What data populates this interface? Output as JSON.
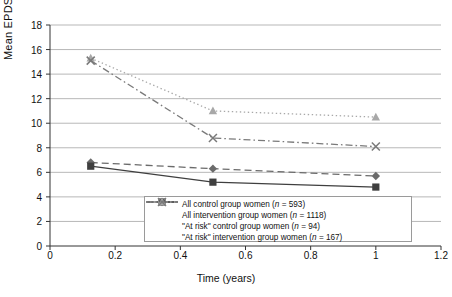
{
  "chart_data": {
    "type": "line",
    "title": "",
    "xlabel": "Time (years)",
    "ylabel": "Mean EPDS score",
    "xlim": [
      0,
      1.2
    ],
    "ylim": [
      0,
      18
    ],
    "xticks": [
      "0",
      "0.2",
      "0.4",
      "0.6",
      "0.8",
      "1",
      "1.2"
    ],
    "xtick_values": [
      0,
      0.2,
      0.4,
      0.6,
      0.8,
      1,
      1.2
    ],
    "yticks": [
      "0",
      "2",
      "4",
      "6",
      "8",
      "10",
      "12",
      "14",
      "16",
      "18"
    ],
    "ytick_values": [
      0,
      2,
      4,
      6,
      8,
      10,
      12,
      14,
      16,
      18
    ],
    "grid": "horizontal",
    "legend_position": "inside-bottom-center",
    "x": [
      0.125,
      0.5,
      1.0
    ],
    "series": [
      {
        "name": "All control group women (n = 593)",
        "label_main": "All control group women (",
        "label_n": "n",
        "label_tail": " = 593)",
        "marker": "diamond",
        "linestyle": "dashed",
        "color": "#6b6b6b",
        "values": [
          6.8,
          6.3,
          5.7
        ]
      },
      {
        "name": "All intervention group women (n = 1118)",
        "label_main": "All intervention group women (",
        "label_n": "n",
        "label_tail": " = 1118)",
        "marker": "square",
        "linestyle": "solid",
        "color": "#3f3f3f",
        "values": [
          6.5,
          5.2,
          4.8
        ]
      },
      {
        "name": "\"At risk\" control group women (n = 94)",
        "label_main": "\"At risk\" control group women (",
        "label_n": "n",
        "label_tail": " = 94)",
        "marker": "triangle",
        "linestyle": "dotted",
        "color": "#a8a8a8",
        "values": [
          15.3,
          11.0,
          10.5
        ]
      },
      {
        "name": "\"At risk\" intervention group women (n = 167)",
        "label_main": "\"At risk\" intervention group women (",
        "label_n": "n",
        "label_tail": " = 167)",
        "marker": "cross",
        "linestyle": "dashdot",
        "color": "#7a7a7a",
        "values": [
          15.1,
          8.8,
          8.1
        ]
      }
    ]
  }
}
